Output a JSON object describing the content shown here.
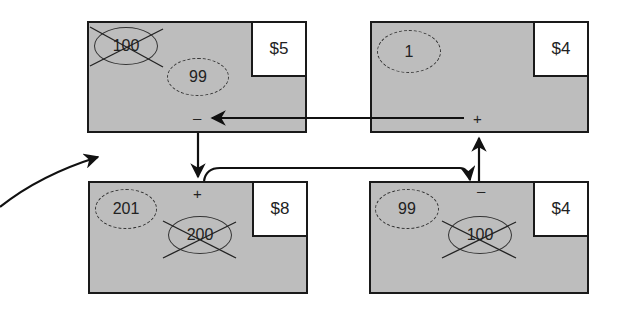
{
  "accounts": [
    {
      "id": "top-left",
      "price": "$5",
      "old_value": "100",
      "new_value": "99",
      "sign": "–"
    },
    {
      "id": "top-right",
      "price": "$4",
      "new_value": "1",
      "sign": "+"
    },
    {
      "id": "bottom-left",
      "price": "$8",
      "old_value": "200",
      "new_value": "201",
      "sign": "+"
    },
    {
      "id": "bottom-right",
      "price": "$4",
      "old_value": "100",
      "new_value": "99",
      "sign": "–"
    }
  ],
  "colors": {
    "box_fill": "#bdbdbd",
    "border": "#1a1a1a",
    "price_fill": "#ffffff"
  }
}
